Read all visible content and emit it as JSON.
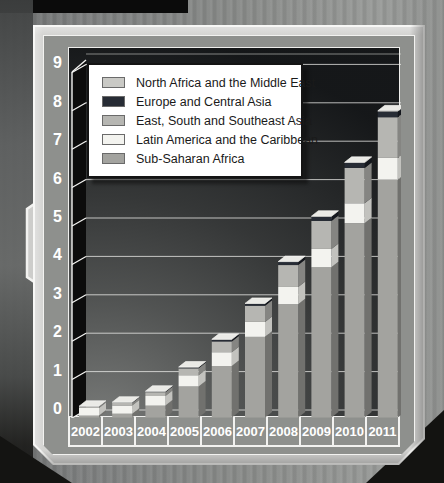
{
  "chart_data": {
    "type": "bar",
    "stacked": true,
    "title": "",
    "xlabel": "",
    "ylabel": "Millions",
    "ylim": [
      0,
      9
    ],
    "yticks": [
      0,
      1,
      2,
      3,
      4,
      5,
      6,
      7,
      8,
      9
    ],
    "grid": true,
    "legend_position": "top-center",
    "categories": [
      "2002",
      "2003",
      "2004",
      "2005",
      "2006",
      "2007",
      "2008",
      "2009",
      "2010",
      "2011"
    ],
    "series": [
      {
        "name": "Sub-Saharan Africa",
        "values": [
          0.05,
          0.1,
          0.31,
          0.81,
          1.34,
          2.1,
          2.95,
          3.91,
          5.06,
          6.2
        ],
        "color": "#a3a39f",
        "side_color": "#71716e"
      },
      {
        "name": "Latin America and the Caribbean",
        "values": [
          0.2,
          0.21,
          0.25,
          0.29,
          0.36,
          0.39,
          0.45,
          0.48,
          0.52,
          0.56
        ],
        "color": "#f3f3ef",
        "side_color": "#c2c2be"
      },
      {
        "name": "East, South and Southeast Asia",
        "values": [
          0.03,
          0.07,
          0.1,
          0.18,
          0.28,
          0.42,
          0.57,
          0.73,
          0.92,
          1.06
        ],
        "color": "#b6b6b2",
        "side_color": "#858582"
      },
      {
        "name": "Europe and Central Asia",
        "values": [
          0.01,
          0.015,
          0.02,
          0.03,
          0.05,
          0.055,
          0.08,
          0.11,
          0.13,
          0.15
        ],
        "color": "#272c35",
        "side_color": "#14171d"
      },
      {
        "name": "North Africa and the Middle East",
        "values": [
          0.002,
          0.003,
          0.004,
          0.004,
          0.005,
          0.006,
          0.01,
          0.012,
          0.015,
          0.017
        ],
        "color": "#c9c9c5",
        "side_color": "#989894"
      }
    ],
    "totals": [
      0.29,
      0.4,
      0.68,
      1.31,
      2.04,
      2.97,
      4.06,
      5.24,
      6.65,
      7.99
    ],
    "legend_order_top_to_bottom": [
      "North Africa and the Middle East",
      "Europe and Central Asia",
      "East, South and Southeast Asia",
      "Latin America and the Caribbean",
      "Sub-Saharan Africa"
    ]
  },
  "styles": {
    "bar_cap_color": "#eaeae6",
    "gridline_color": "#f0f0ee",
    "wall_color": "#0c0c0c",
    "axis_text_color": "#ffffff",
    "mat_color": "#8e908d",
    "frame_color": "#d4d4d2",
    "plot_dark": "#17191b"
  }
}
